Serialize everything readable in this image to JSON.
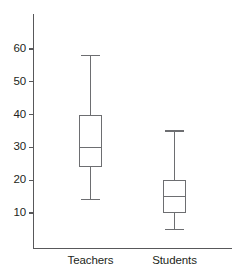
{
  "chart_data": {
    "type": "box",
    "title": "",
    "xlabel": "",
    "ylabel": "",
    "categories": [
      "Teachers",
      "Students"
    ],
    "ytick_labels": [
      "60",
      "50",
      "40",
      "30",
      "20",
      "10"
    ],
    "yticks": [
      60,
      50,
      40,
      30,
      20,
      10
    ],
    "ylim": [
      0,
      68
    ],
    "grid": false,
    "legend": null,
    "series": [
      {
        "name": "Teachers",
        "min": 14,
        "q1": 24,
        "median": 30,
        "q3": 40,
        "max": 58
      },
      {
        "name": "Students",
        "min": 5,
        "q1": 10,
        "median": 15,
        "q3": 20,
        "max": 35
      }
    ],
    "colors": {
      "axis": "#58585a",
      "box_stroke": "#6d6e71",
      "text": "#231f20",
      "background": "#ffffff"
    }
  },
  "axes": {
    "y_axis_name": "y-axis",
    "x_axis_name": "x-axis"
  }
}
